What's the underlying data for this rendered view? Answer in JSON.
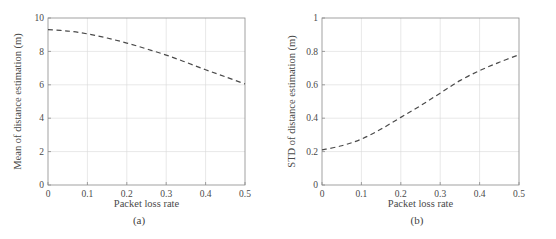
{
  "figure": {
    "panels": [
      {
        "id": "a",
        "caption": "(a)",
        "chart_data": {
          "type": "line",
          "title": "",
          "xlabel": "Packet loss rate",
          "ylabel": "Mean of distance estimation (m)",
          "xlim": [
            0,
            0.5
          ],
          "ylim": [
            0,
            10
          ],
          "xticks": [
            0,
            0.1,
            0.2,
            0.3,
            0.4,
            0.5
          ],
          "xticklabels": [
            "0",
            "0.1",
            "0.2",
            "0.3",
            "0.4",
            "0.5"
          ],
          "yticks": [
            0,
            2,
            4,
            6,
            8,
            10
          ],
          "yticklabels": [
            "0",
            "2",
            "4",
            "6",
            "8",
            "10"
          ],
          "grid": true,
          "legend": null,
          "series": [
            {
              "name": "Mean of distance estimation",
              "style": "dashed",
              "color": "#4a4a4a",
              "x": [
                0,
                0.05,
                0.1,
                0.15,
                0.2,
                0.25,
                0.3,
                0.35,
                0.4,
                0.45,
                0.5
              ],
              "y": [
                9.3,
                9.22,
                9.05,
                8.8,
                8.5,
                8.15,
                7.78,
                7.35,
                6.9,
                6.48,
                6.05
              ]
            }
          ]
        }
      },
      {
        "id": "b",
        "caption": "(b)",
        "chart_data": {
          "type": "line",
          "title": "",
          "xlabel": "Packet loss rate",
          "ylabel": "STD of distance estimation (m)",
          "xlim": [
            0,
            0.5
          ],
          "ylim": [
            0,
            1
          ],
          "xticks": [
            0,
            0.1,
            0.2,
            0.3,
            0.4,
            0.5
          ],
          "xticklabels": [
            "0",
            "0.1",
            "0.2",
            "0.3",
            "0.4",
            "0.5"
          ],
          "yticks": [
            0,
            0.2,
            0.4,
            0.6,
            0.8,
            1
          ],
          "yticklabels": [
            "0",
            "0.2",
            "0.4",
            "0.6",
            "0.8",
            "1"
          ],
          "grid": true,
          "legend": null,
          "series": [
            {
              "name": "STD of distance estimation",
              "style": "dashed",
              "color": "#4a4a4a",
              "x": [
                0,
                0.05,
                0.1,
                0.15,
                0.2,
                0.25,
                0.3,
                0.35,
                0.4,
                0.45,
                0.5
              ],
              "y": [
                0.21,
                0.235,
                0.275,
                0.335,
                0.405,
                0.475,
                0.55,
                0.625,
                0.685,
                0.735,
                0.78
              ]
            }
          ]
        }
      }
    ]
  },
  "style": {
    "axis_color": "#8a8a8a",
    "grid_color": "#d9d9d9",
    "curve_color": "#4a4a4a",
    "text_color": "#4a4a4a"
  }
}
